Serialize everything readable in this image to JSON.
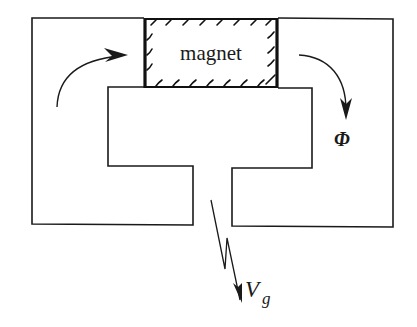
{
  "diagram": {
    "type": "magnetic circuit with permanent magnet and air gap",
    "magnet_label": "magnet",
    "flux_label": "Φ",
    "voltage_label_main": "V",
    "voltage_label_sub": "g",
    "colors": {
      "line": "#1a1a1a",
      "background": "#ffffff"
    }
  }
}
